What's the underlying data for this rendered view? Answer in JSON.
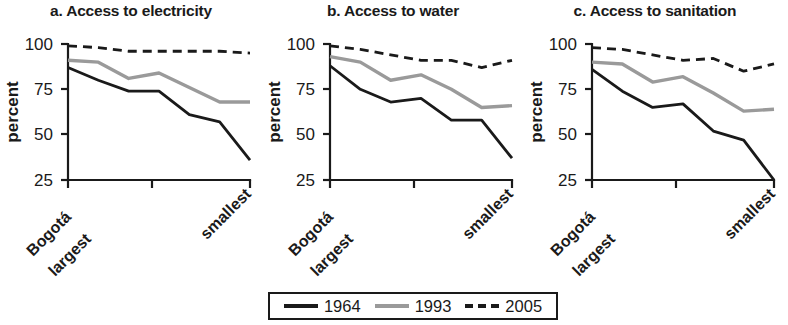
{
  "figure": {
    "ylabel": "percent",
    "ytick_labels": [
      "100",
      "75",
      "50",
      "25"
    ],
    "ytick_values": [
      100,
      75,
      50,
      25
    ],
    "xtick_label_left_line1": "Bogotá",
    "xtick_label_left_line2": "largest",
    "xtick_label_right": "smallest"
  },
  "legend": {
    "items": [
      {
        "label": "1964",
        "style": "solid-black",
        "color": "#1a1a1a"
      },
      {
        "label": "1993",
        "style": "solid-gray",
        "color": "#9a9a9a"
      },
      {
        "label": "2005",
        "style": "dashed-black",
        "color": "#1a1a1a"
      }
    ]
  },
  "panels": [
    {
      "title": "a. Access to electricity"
    },
    {
      "title": "b. Access to water"
    },
    {
      "title": "c. Access to sanitation"
    }
  ],
  "chart_data": [
    {
      "type": "line",
      "title": "a. Access to electricity",
      "xlabel": "",
      "ylabel": "percent",
      "ylim": [
        25,
        100
      ],
      "grid": false,
      "legend_position": "bottom-center",
      "categories": [
        "Bogotá largest",
        "2",
        "3",
        "4",
        "5",
        "6",
        "smallest"
      ],
      "x": [
        0,
        1,
        2,
        3,
        4,
        5,
        6
      ],
      "series": [
        {
          "name": "1964",
          "values": [
            87,
            80,
            74,
            74,
            61,
            57,
            36
          ]
        },
        {
          "name": "1993",
          "values": [
            91,
            90,
            81,
            84,
            76,
            68,
            68
          ]
        },
        {
          "name": "2005",
          "values": [
            99,
            98,
            96,
            96,
            96,
            96,
            95
          ]
        }
      ]
    },
    {
      "type": "line",
      "title": "b. Access to water",
      "xlabel": "",
      "ylabel": "percent",
      "ylim": [
        25,
        100
      ],
      "grid": false,
      "legend_position": "bottom-center",
      "categories": [
        "Bogotá largest",
        "2",
        "3",
        "4",
        "5",
        "6",
        "smallest"
      ],
      "x": [
        0,
        1,
        2,
        3,
        4,
        5,
        6
      ],
      "series": [
        {
          "name": "1964",
          "values": [
            88,
            75,
            68,
            70,
            58,
            58,
            37
          ]
        },
        {
          "name": "1993",
          "values": [
            93,
            90,
            80,
            83,
            75,
            65,
            66
          ]
        },
        {
          "name": "2005",
          "values": [
            99,
            97,
            94,
            91,
            91,
            87,
            91
          ]
        }
      ]
    },
    {
      "type": "line",
      "title": "c. Access to sanitation",
      "xlabel": "",
      "ylabel": "percent",
      "ylim": [
        25,
        100
      ],
      "grid": false,
      "legend_position": "bottom-center",
      "categories": [
        "Bogotá largest",
        "2",
        "3",
        "4",
        "5",
        "6",
        "smallest"
      ],
      "x": [
        0,
        1,
        2,
        3,
        4,
        5,
        6
      ],
      "series": [
        {
          "name": "1964",
          "values": [
            86,
            74,
            65,
            67,
            52,
            47,
            25
          ]
        },
        {
          "name": "1993",
          "values": [
            90,
            89,
            79,
            82,
            73,
            63,
            64
          ]
        },
        {
          "name": "2005",
          "values": [
            98,
            97,
            94,
            91,
            92,
            85,
            89
          ]
        }
      ]
    }
  ]
}
